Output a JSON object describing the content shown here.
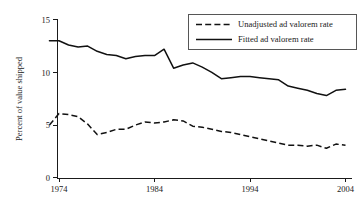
{
  "chart_data": {
    "type": "line",
    "title": "",
    "subtitle": "",
    "xlabel": "",
    "ylabel": "Percent of value shipped",
    "xlim": [
      1973,
      2004
    ],
    "ylim": [
      0,
      15
    ],
    "xticks": [
      1974,
      1984,
      1994,
      2004
    ],
    "yticks": [
      0,
      5,
      10,
      15
    ],
    "xtick_labels": [
      "1974",
      "1984",
      "1994",
      "2004"
    ],
    "ytick_labels": [
      "0",
      "5",
      "10",
      "15"
    ],
    "grid": false,
    "legend_position": "top-right",
    "x": [
      1973,
      1974,
      1975,
      1976,
      1977,
      1978,
      1979,
      1980,
      1981,
      1982,
      1983,
      1984,
      1985,
      1986,
      1987,
      1988,
      1989,
      1990,
      1991,
      1992,
      1993,
      1994,
      1995,
      1996,
      1997,
      1998,
      1999,
      2000,
      2001,
      2002,
      2003,
      2004
    ],
    "series": [
      {
        "name": "Unadjusted ad valorem rate",
        "style": "dashed",
        "color": "#111111",
        "values": [
          5.0,
          6.1,
          6.0,
          5.8,
          5.1,
          4.1,
          4.3,
          4.6,
          4.6,
          5.0,
          5.3,
          5.2,
          5.3,
          5.5,
          5.4,
          4.9,
          4.8,
          4.6,
          4.4,
          4.3,
          4.1,
          3.9,
          3.7,
          3.5,
          3.3,
          3.1,
          3.1,
          3.0,
          3.1,
          2.8,
          3.2,
          3.1
        ]
      },
      {
        "name": "Fitted ad valorem rate",
        "style": "solid",
        "color": "#111111",
        "values": [
          13.0,
          13.0,
          12.6,
          12.4,
          12.5,
          12.0,
          11.7,
          11.6,
          11.3,
          11.5,
          11.6,
          11.6,
          12.2,
          10.4,
          10.7,
          10.9,
          10.5,
          10.0,
          9.4,
          9.5,
          9.6,
          9.6,
          9.5,
          9.4,
          9.3,
          8.7,
          8.5,
          8.3,
          8.0,
          7.8,
          8.3,
          8.4
        ]
      }
    ],
    "legend_entries": [
      {
        "label": "Unadjusted ad valorem rate",
        "style": "dashed"
      },
      {
        "label": "Fitted ad valorem rate",
        "style": "solid"
      }
    ]
  }
}
